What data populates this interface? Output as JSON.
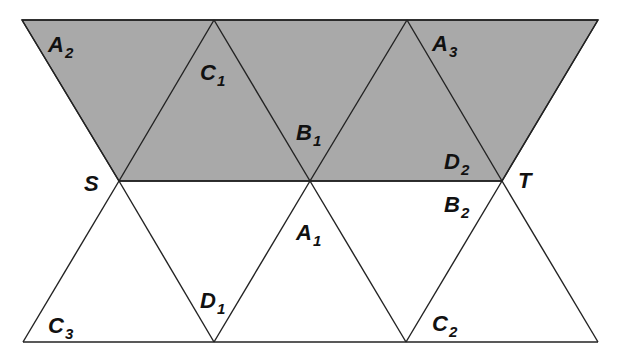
{
  "diagram": {
    "type": "net of tetrahedra / triangular strip",
    "shade_color": "#a9a9a9",
    "line_color": "#222222",
    "background": "#ffffff",
    "shaded_region": {
      "description": "upper trapezoid strip between top edge and line ST",
      "points": [
        [
          22,
          20
        ],
        [
          598,
          20
        ],
        [
          502,
          181
        ],
        [
          119,
          181
        ]
      ]
    },
    "vertices": {
      "S": [
        119,
        181
      ],
      "T": [
        502,
        181
      ],
      "M": [
        310,
        181
      ],
      "top_left": [
        22,
        20
      ],
      "top_1": [
        214,
        20
      ],
      "top_2": [
        407,
        20
      ],
      "top_right": [
        598,
        20
      ],
      "bottom_left": [
        23,
        342
      ],
      "bottom_1": [
        214,
        342
      ],
      "bottom_2": [
        406,
        342
      ],
      "bottom_right": [
        598,
        342
      ]
    },
    "labels": [
      {
        "id": "S",
        "base": "S",
        "sub": "",
        "x": 84,
        "y": 191
      },
      {
        "id": "T",
        "base": "T",
        "sub": "",
        "x": 518,
        "y": 188
      },
      {
        "id": "A2",
        "base": "A",
        "sub": "2",
        "x": 48,
        "y": 52
      },
      {
        "id": "C1",
        "base": "C",
        "sub": "1",
        "x": 200,
        "y": 80
      },
      {
        "id": "B1",
        "base": "B",
        "sub": "1",
        "x": 296,
        "y": 140
      },
      {
        "id": "A3",
        "base": "A",
        "sub": "3",
        "x": 432,
        "y": 51
      },
      {
        "id": "D2",
        "base": "D",
        "sub": "2",
        "x": 444,
        "y": 169
      },
      {
        "id": "B2",
        "base": "B",
        "sub": "2",
        "x": 444,
        "y": 212
      },
      {
        "id": "A1",
        "base": "A",
        "sub": "1",
        "x": 296,
        "y": 240
      },
      {
        "id": "D1",
        "base": "D",
        "sub": "1",
        "x": 200,
        "y": 308
      },
      {
        "id": "C3",
        "base": "C",
        "sub": "3",
        "x": 48,
        "y": 333
      },
      {
        "id": "C2",
        "base": "C",
        "sub": "2",
        "x": 432,
        "y": 331
      }
    ]
  }
}
